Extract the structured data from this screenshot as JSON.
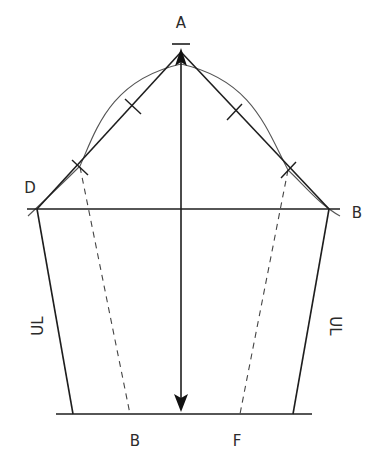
{
  "diagram": {
    "type": "sleeve-pattern-draft",
    "labels": {
      "apex": "A",
      "left_point": "D",
      "right_point": "B",
      "left_seam": "UL",
      "right_seam": "UL",
      "bottom_left": "B",
      "bottom_right": "F"
    },
    "colors": {
      "line": "#1e1e1e",
      "curve": "#555555",
      "dashed": "#444444",
      "background": "#ffffff"
    },
    "points": {
      "A": [
        181,
        52
      ],
      "left_corner": [
        37,
        209
      ],
      "right_corner": [
        329,
        209
      ],
      "bottom_left": [
        73,
        414
      ],
      "bottom_right": [
        293,
        414
      ],
      "center_bottom": [
        181,
        414
      ]
    },
    "tick_marks": 4,
    "dashed_guides": 2
  }
}
